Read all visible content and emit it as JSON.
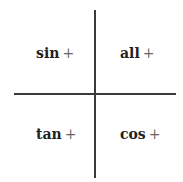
{
  "diagram": {
    "type": "quadrant-sign-chart",
    "axes": {
      "color": "#3a3a3a"
    },
    "quadrants": [
      {
        "position": "top-left",
        "function": "sin",
        "sign": "+"
      },
      {
        "position": "top-right",
        "function": "all",
        "sign": "+"
      },
      {
        "position": "bottom-left",
        "function": "tan",
        "sign": "+"
      },
      {
        "position": "bottom-right",
        "function": "cos",
        "sign": "+"
      }
    ]
  }
}
